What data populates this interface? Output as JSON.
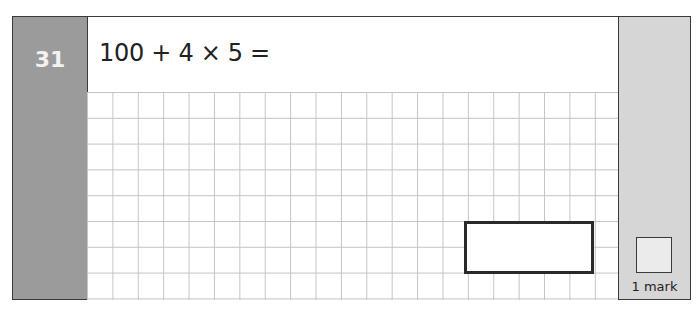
{
  "question": {
    "number": "31",
    "text": "100 + 4 × 5 =",
    "marks_label": "1 mark"
  },
  "colors": {
    "number_column": "#9b9b9b",
    "marks_column": "#d6d6d6",
    "grid_lines": "#c4c4c4",
    "border": "#3a3a3a"
  }
}
